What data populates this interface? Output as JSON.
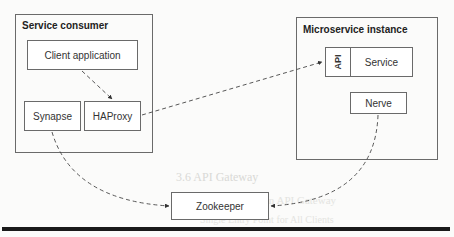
{
  "diagram": {
    "containers": {
      "consumer": {
        "title": "Service consumer"
      },
      "instance": {
        "title": "Microservice instance"
      }
    },
    "nodes": {
      "client_app": "Client application",
      "synapse": "Synapse",
      "haproxy": "HAProxy",
      "api": "API",
      "service": "Service",
      "nerve": "Nerve",
      "zookeeper": "Zookeeper"
    },
    "edges": [
      {
        "from": "Client application",
        "to": "HAProxy",
        "style": "dashed",
        "arrow": "end"
      },
      {
        "from": "HAProxy",
        "to": "API",
        "style": "dashed",
        "arrow": "end"
      },
      {
        "from": "Synapse",
        "to": "Zookeeper",
        "style": "dashed",
        "arrow": "end"
      },
      {
        "from": "Nerve",
        "to": "Zookeeper",
        "style": "dashed",
        "arrow": "end"
      }
    ],
    "colors": {
      "border": "#6a6a6a",
      "edge": "#444444",
      "rule": "#1a1a1a"
    }
  },
  "background_text": {
    "line1": "3.6 API Gateway",
    "line2": "3.6.1 The Need for an API Gateway",
    "line3": "Single Entry Point for All Clients"
  }
}
